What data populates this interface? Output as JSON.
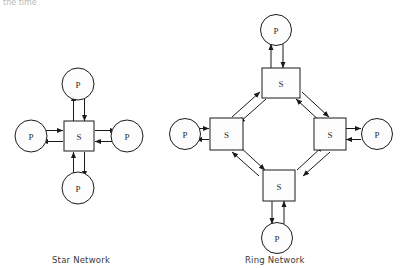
{
  "page": {
    "background_color": "#ffffff",
    "line_color": "#1a1a1a",
    "node_fill": "#fdfdfd",
    "header_fragment": "the time"
  },
  "captions": {
    "star": "Star Network",
    "ring": "Ring Network"
  },
  "diagrams": [
    {
      "name": "star-network",
      "caption": "Star Network",
      "center": {
        "type": "square",
        "label": "S",
        "x": 79,
        "y": 136
      },
      "nodes": [
        {
          "type": "circle",
          "label": "P",
          "position": "top",
          "x": 78,
          "y": 84
        },
        {
          "type": "circle",
          "label": "P",
          "position": "left",
          "x": 31,
          "y": 136
        },
        {
          "type": "circle",
          "label": "P",
          "position": "right",
          "x": 127,
          "y": 136
        },
        {
          "type": "circle",
          "label": "P",
          "position": "bottom",
          "x": 78,
          "y": 188
        }
      ],
      "link_style": "bidirectional-double-arrow"
    },
    {
      "name": "ring-network",
      "caption": "Ring Network",
      "switches": [
        {
          "type": "square",
          "label": "S",
          "position": "top",
          "x": 281,
          "y": 83
        },
        {
          "type": "square",
          "label": "S",
          "position": "left",
          "x": 226,
          "y": 134
        },
        {
          "type": "square",
          "label": "S",
          "position": "right",
          "x": 330,
          "y": 134
        },
        {
          "type": "square",
          "label": "S",
          "position": "bottom",
          "x": 279,
          "y": 185
        }
      ],
      "hosts": [
        {
          "type": "circle",
          "label": "P",
          "position": "top",
          "x": 276,
          "y": 30
        },
        {
          "type": "circle",
          "label": "P",
          "position": "left",
          "x": 185,
          "y": 134
        },
        {
          "type": "circle",
          "label": "P",
          "position": "right",
          "x": 377,
          "y": 134
        },
        {
          "type": "circle",
          "label": "P",
          "position": "bottom",
          "x": 277,
          "y": 238
        }
      ],
      "link_style": "bidirectional-double-arrow",
      "ring_edges": [
        [
          "top",
          "left"
        ],
        [
          "left",
          "bottom"
        ],
        [
          "bottom",
          "right"
        ],
        [
          "right",
          "top"
        ]
      ]
    }
  ]
}
